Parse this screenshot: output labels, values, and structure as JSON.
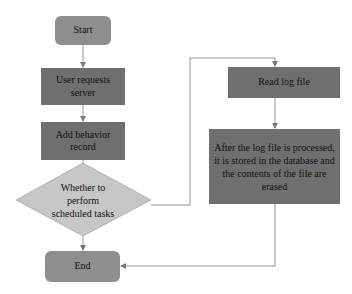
{
  "diagram": {
    "type": "flowchart",
    "colors": {
      "terminal": "#8e8e8e",
      "process": "#6f6f6f",
      "decision": "#c6c6c6",
      "connector": "#7a7a7a",
      "background": "#ffffff"
    },
    "nodes": {
      "start": {
        "label": "Start",
        "shape": "rounded-rect"
      },
      "user_requests": {
        "label": "User requests server",
        "shape": "rect"
      },
      "add_record": {
        "label": "Add behavior record",
        "shape": "rect"
      },
      "decision": {
        "label": "Whether to perform scheduled tasks",
        "shape": "diamond"
      },
      "end": {
        "label": "End",
        "shape": "rounded-rect"
      },
      "read_log": {
        "label": "Read log file",
        "shape": "rect"
      },
      "store_erase": {
        "label": "After the log file is processed, it is stored in the database and the contents of the file are erased",
        "shape": "rect"
      }
    },
    "edges": [
      {
        "from": "start",
        "to": "user_requests"
      },
      {
        "from": "user_requests",
        "to": "add_record"
      },
      {
        "from": "add_record",
        "to": "decision"
      },
      {
        "from": "decision",
        "to": "end"
      },
      {
        "from": "decision",
        "to": "read_log"
      },
      {
        "from": "read_log",
        "to": "store_erase"
      },
      {
        "from": "store_erase",
        "to": "end"
      }
    ]
  }
}
